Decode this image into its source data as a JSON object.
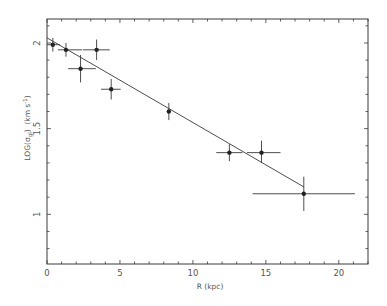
{
  "chart_data": {
    "type": "scatter",
    "title": "",
    "xlabel": "R (kpc)",
    "ylabel": "LOG(σ_gl) (km s⁻¹)",
    "ylabel_parts": {
      "main": "LOG(σ",
      "sub": "gl",
      "close": ")",
      "units": "(km s",
      "sup": "-1",
      "units_close": ")"
    },
    "xlim": [
      0,
      22
    ],
    "ylim": [
      0.71,
      2.14
    ],
    "xticks": [
      0,
      5,
      10,
      15,
      20
    ],
    "xtick_labels": [
      "0",
      "5",
      "10",
      "15",
      "20"
    ],
    "xminor_step": 1,
    "yticks": [
      1,
      1.5,
      2
    ],
    "ytick_labels": [
      "1",
      "1.5",
      "2"
    ],
    "yminor_step": 0.1,
    "grid": false,
    "legend": null,
    "series": [
      {
        "name": "data",
        "marker": "filled-circle",
        "points": [
          {
            "x": 0.4,
            "y": 1.99,
            "xerr": [
              0.0,
              0.9
            ],
            "yerr": [
              1.95,
              2.03
            ]
          },
          {
            "x": 1.3,
            "y": 1.96,
            "xerr": [
              0.75,
              2.4
            ],
            "yerr": [
              1.92,
              2.0
            ]
          },
          {
            "x": 2.3,
            "y": 1.85,
            "xerr": [
              1.45,
              3.35
            ],
            "yerr": [
              1.77,
              1.93
            ]
          },
          {
            "x": 3.4,
            "y": 1.96,
            "xerr": [
              2.45,
              4.3
            ],
            "yerr": [
              1.9,
              2.02
            ]
          },
          {
            "x": 4.4,
            "y": 1.73,
            "xerr": [
              3.7,
              5.05
            ],
            "yerr": [
              1.67,
              1.79
            ]
          },
          {
            "x": 8.35,
            "y": 1.6,
            "xerr": [
              8.25,
              8.45
            ],
            "yerr": [
              1.55,
              1.65
            ]
          },
          {
            "x": 12.5,
            "y": 1.36,
            "xerr": [
              11.6,
              13.4
            ],
            "yerr": [
              1.31,
              1.41
            ]
          },
          {
            "x": 14.7,
            "y": 1.36,
            "xerr": [
              13.7,
              16.0
            ],
            "yerr": [
              1.3,
              1.43
            ]
          },
          {
            "x": 17.6,
            "y": 1.12,
            "xerr": [
              14.1,
              21.1
            ],
            "yerr": [
              1.02,
              1.22
            ]
          }
        ]
      },
      {
        "name": "linear fit",
        "type": "line",
        "x": [
          0,
          17.6
        ],
        "y": [
          2.03,
          1.16
        ]
      }
    ]
  },
  "style": {
    "ink": "#3a3a3a",
    "text": "#555555",
    "background": "#ffffff"
  }
}
